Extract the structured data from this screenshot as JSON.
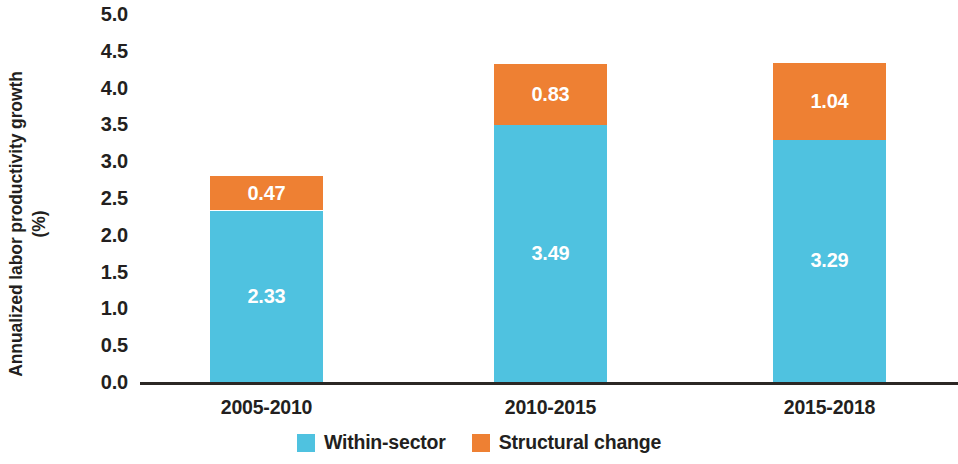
{
  "chart_data": {
    "type": "bar",
    "stacked": true,
    "title": "",
    "subtitle": "",
    "xlabel": "",
    "ylabel": "Annualized labor productivity growth",
    "ylabel_unit": "(%)",
    "categories": [
      "2005-2010",
      "2010-2015",
      "2015-2018"
    ],
    "series": [
      {
        "name": "Within-sector",
        "color": "#4FC2E0",
        "values": [
          2.33,
          3.49,
          3.29
        ],
        "labels": [
          "2.33",
          "3.49",
          "3.29"
        ]
      },
      {
        "name": "Structural change",
        "color": "#EE8033",
        "values": [
          0.47,
          0.83,
          1.04
        ],
        "labels": [
          "0.47",
          "0.83",
          "1.04"
        ]
      }
    ],
    "totals": [
      2.8,
      4.32,
      4.33
    ],
    "ylim": [
      0.0,
      5.0
    ],
    "ytick_step": 0.5,
    "ytick_labels": [
      "5.0",
      "4.5",
      "4.0",
      "3.5",
      "3.0",
      "2.5",
      "2.0",
      "1.5",
      "1.0",
      "0.5",
      "0.0"
    ],
    "ytick_values": [
      5.0,
      4.5,
      4.0,
      3.5,
      3.0,
      2.5,
      2.0,
      1.5,
      1.0,
      0.5,
      0.0
    ],
    "grid": false,
    "legend_position": "bottom",
    "axis_color": "#2B2724"
  },
  "legend": {
    "items": [
      {
        "label": "Within-sector",
        "color": "#4FC2E0"
      },
      {
        "label": "Structural change",
        "color": "#EE8033"
      }
    ]
  }
}
